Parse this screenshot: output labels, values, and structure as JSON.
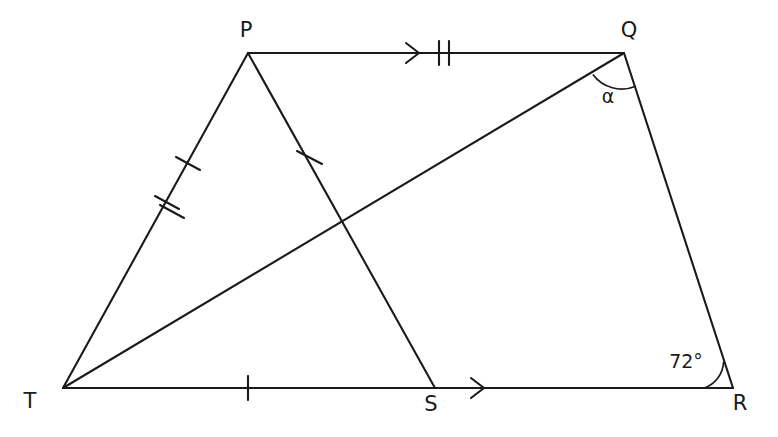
{
  "figure": {
    "background_color": "#ffffff",
    "stroke_color": "#1a1a1a",
    "width": 778,
    "height": 437,
    "vertices": {
      "P": {
        "label": "P",
        "x": 248,
        "y": 53,
        "label_x": 246,
        "label_y": 31
      },
      "Q": {
        "label": "Q",
        "x": 624,
        "y": 53,
        "label_x": 629,
        "label_y": 31
      },
      "R": {
        "label": "R",
        "x": 733,
        "y": 388,
        "label_x": 740,
        "label_y": 404
      },
      "S": {
        "label": "S",
        "x": 435,
        "y": 388,
        "label_x": 431,
        "label_y": 405
      },
      "T": {
        "label": "T",
        "x": 63,
        "y": 388,
        "label_x": 30,
        "label_y": 402
      }
    },
    "segments": [
      {
        "name": "segment-PQ",
        "from": "P",
        "to": "Q",
        "ticks": 2,
        "arrows": 1
      },
      {
        "name": "segment-QR",
        "from": "Q",
        "to": "R",
        "ticks": 0,
        "arrows": 0
      },
      {
        "name": "segment-TR",
        "from": "T",
        "to": "R",
        "ticks": 1,
        "arrows": 1
      },
      {
        "name": "segment-TP",
        "from": "T",
        "to": "P",
        "ticks": 3,
        "arrows": 0
      },
      {
        "name": "segment-TQ",
        "from": "T",
        "to": "Q",
        "ticks": 0,
        "arrows": 0
      },
      {
        "name": "segment-PS",
        "from": "P",
        "to": "S",
        "ticks": 1,
        "arrows": 0
      }
    ],
    "angles": [
      {
        "name": "angle-at-Q",
        "label": "α",
        "vertex": "Q",
        "label_x": 608,
        "label_y": 97,
        "arc_radius": 36
      },
      {
        "name": "angle-at-R",
        "label": "72°",
        "vertex": "R",
        "label_x": 686,
        "label_y": 362,
        "arc_radius": 29
      }
    ],
    "tick_positions": {
      "pq_double_tick_x": 443,
      "pq_arrow_x": 416,
      "tr_single_tick_x": 248,
      "tr_arrow_x": 481,
      "tp_single_tick": {
        "x": 188,
        "y": 163
      },
      "tp_double_tick": {
        "x": 168,
        "y": 207
      },
      "ps_single_tick": {
        "x": 310,
        "y": 158
      }
    },
    "intersection": {
      "name": "TQ-PS-crossing",
      "x": 343,
      "y": 222
    }
  }
}
